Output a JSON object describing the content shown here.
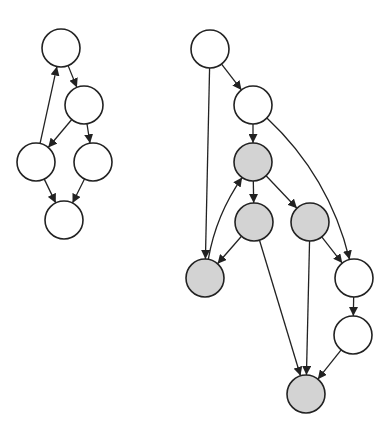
{
  "diagram": {
    "title": "",
    "colors": {
      "stroke": "#222222",
      "white_fill": "#ffffff",
      "gray_fill": "#d3d3d3",
      "background": "#ffffff"
    },
    "node_radius": 19,
    "graphs": [
      {
        "id": "left-graph",
        "nodes": [
          {
            "id": "L1",
            "x": 61,
            "y": 48,
            "shaded": false
          },
          {
            "id": "L2",
            "x": 84,
            "y": 105,
            "shaded": false
          },
          {
            "id": "L3",
            "x": 36,
            "y": 162,
            "shaded": false
          },
          {
            "id": "L4",
            "x": 93,
            "y": 162,
            "shaded": false
          },
          {
            "id": "L5",
            "x": 64,
            "y": 220,
            "shaded": false
          }
        ],
        "edges": [
          {
            "from": "L1",
            "to": "L2",
            "curve": 0
          },
          {
            "from": "L2",
            "to": "L3",
            "curve": 0
          },
          {
            "from": "L2",
            "to": "L4",
            "curve": 0
          },
          {
            "from": "L3",
            "to": "L1",
            "curve": 0
          },
          {
            "from": "L3",
            "to": "L5",
            "curve": 0
          },
          {
            "from": "L4",
            "to": "L5",
            "curve": 0
          }
        ]
      },
      {
        "id": "right-graph",
        "nodes": [
          {
            "id": "R1",
            "x": 210,
            "y": 49,
            "shaded": false
          },
          {
            "id": "R2",
            "x": 253,
            "y": 105,
            "shaded": false
          },
          {
            "id": "R3",
            "x": 253,
            "y": 162,
            "shaded": true
          },
          {
            "id": "R4",
            "x": 254,
            "y": 222,
            "shaded": true
          },
          {
            "id": "R5",
            "x": 310,
            "y": 222,
            "shaded": true
          },
          {
            "id": "R6",
            "x": 205,
            "y": 278,
            "shaded": true
          },
          {
            "id": "R7",
            "x": 354,
            "y": 278,
            "shaded": false
          },
          {
            "id": "R8",
            "x": 353,
            "y": 335,
            "shaded": false
          },
          {
            "id": "R9",
            "x": 306,
            "y": 394,
            "shaded": true
          }
        ],
        "edges": [
          {
            "from": "R1",
            "to": "R2",
            "curve": 0
          },
          {
            "from": "R1",
            "to": "R6",
            "curve": 0
          },
          {
            "from": "R2",
            "to": "R3",
            "curve": 0
          },
          {
            "from": "R2",
            "to": "R7",
            "curve": -30
          },
          {
            "from": "R3",
            "to": "R4",
            "curve": 0
          },
          {
            "from": "R3",
            "to": "R5",
            "curve": 0
          },
          {
            "from": "R6",
            "to": "R3",
            "curve": -14
          },
          {
            "from": "R4",
            "to": "R6",
            "curve": 0
          },
          {
            "from": "R4",
            "to": "R9",
            "curve": 0
          },
          {
            "from": "R5",
            "to": "R9",
            "curve": 0
          },
          {
            "from": "R5",
            "to": "R7",
            "curve": 0
          },
          {
            "from": "R7",
            "to": "R8",
            "curve": 0
          },
          {
            "from": "R8",
            "to": "R9",
            "curve": 0
          }
        ]
      }
    ]
  }
}
